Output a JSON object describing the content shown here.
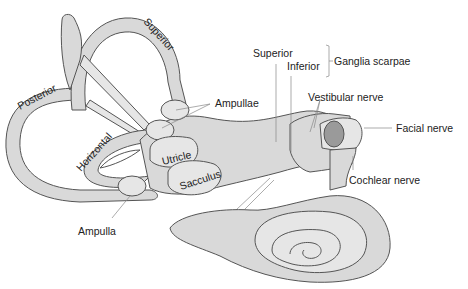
{
  "diagram": {
    "colors": {
      "fill": "#d9d9d9",
      "fill_light": "#e6e6e6",
      "outline": "#555555",
      "nerve_cut": "#9a9a9a",
      "text": "#222222"
    },
    "labels": {
      "superior_canal": "Superior",
      "posterior_canal": "Posterior",
      "horizontal_canal": "Horizontal",
      "ampullae": "Ampullae",
      "utricle": "Utricle",
      "sacculus": "Sacculus",
      "ampulla": "Ampulla",
      "ganglia_superior": "Superior",
      "ganglia_inferior": "Inferior",
      "ganglia_scarpae": "Ganglia scarpae",
      "vestibular_nerve": "Vestibular nerve",
      "facial_nerve": "Facial nerve",
      "cochlear_nerve": "Cochlear nerve"
    }
  }
}
